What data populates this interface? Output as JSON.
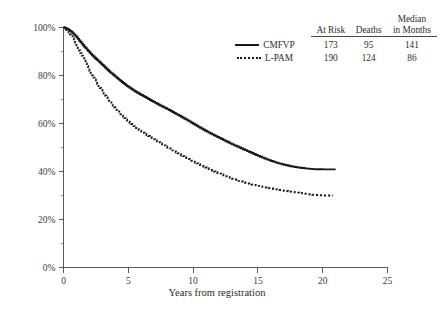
{
  "chart_data": {
    "type": "line",
    "title": "",
    "xlabel": "Years from registration",
    "ylabel": "",
    "xlim": [
      0,
      25
    ],
    "ylim": [
      0,
      100
    ],
    "grid": false,
    "x_ticks": [
      "0",
      "5",
      "10",
      "15",
      "20",
      "25"
    ],
    "x_tick_values": [
      0,
      5,
      10,
      15,
      20,
      25
    ],
    "y_ticks": [
      "0%",
      "20%",
      "40%",
      "60%",
      "80%",
      "100%"
    ],
    "y_tick_values": [
      0,
      20,
      40,
      60,
      80,
      100
    ],
    "y_minor_tick_values": [
      10,
      30,
      50,
      70,
      90
    ],
    "legend_position": "top-right",
    "series": [
      {
        "name": "CMFVP",
        "style": "solid",
        "at_risk": 173,
        "deaths": 95,
        "median_months": 141,
        "x": [
          0,
          0.3,
          0.6,
          0.9,
          1.2,
          1.5,
          1.8,
          2.1,
          2.4,
          2.7,
          3.0,
          3.3,
          3.6,
          3.9,
          4.2,
          4.5,
          4.8,
          5.1,
          5.4,
          5.7,
          6.0,
          6.4,
          6.8,
          7.2,
          7.6,
          8.0,
          8.4,
          8.8,
          9.2,
          9.6,
          10.0,
          10.4,
          10.8,
          11.2,
          11.6,
          12.0,
          12.5,
          13.0,
          13.5,
          14.0,
          14.5,
          15.0,
          15.5,
          16.0,
          16.5,
          17.0,
          17.5,
          18.0,
          18.6,
          19.2,
          20.0,
          21.0
        ],
        "y": [
          100,
          99.4,
          98.2,
          96.6,
          94.6,
          92.6,
          90.8,
          89.0,
          87.4,
          85.9,
          84.4,
          82.8,
          81.3,
          80.0,
          78.6,
          77.3,
          76.0,
          74.9,
          73.8,
          72.8,
          71.9,
          70.6,
          69.4,
          68.2,
          67.1,
          66.0,
          64.8,
          63.6,
          62.4,
          61.2,
          59.9,
          58.6,
          57.4,
          56.2,
          55.1,
          54.0,
          52.6,
          51.3,
          50.1,
          48.9,
          47.7,
          46.5,
          45.4,
          44.4,
          43.5,
          42.8,
          42.2,
          41.7,
          41.3,
          41.0,
          40.9,
          40.9
        ]
      },
      {
        "name": "L-PAM",
        "style": "dotted",
        "at_risk": 190,
        "deaths": 124,
        "median_months": 86,
        "x": [
          0,
          0.3,
          0.6,
          0.9,
          1.2,
          1.5,
          1.8,
          2.1,
          2.4,
          2.7,
          3.0,
          3.3,
          3.6,
          3.9,
          4.2,
          4.5,
          4.8,
          5.1,
          5.4,
          5.7,
          6.0,
          6.4,
          6.8,
          7.2,
          7.6,
          8.0,
          8.4,
          8.8,
          9.2,
          9.6,
          10.0,
          10.4,
          10.8,
          11.2,
          11.6,
          12.0,
          12.5,
          13.0,
          13.5,
          14.0,
          14.5,
          15.0,
          15.5,
          16.0,
          16.5,
          17.0,
          17.5,
          18.0,
          18.6,
          19.2,
          20.0,
          20.8
        ],
        "y": [
          100,
          98.6,
          96.4,
          93.6,
          90.4,
          87.2,
          84.0,
          81.0,
          78.2,
          75.6,
          73.2,
          70.9,
          68.8,
          66.8,
          65.0,
          63.3,
          61.7,
          60.2,
          58.9,
          57.7,
          56.6,
          55.2,
          53.9,
          52.6,
          51.3,
          50.0,
          48.8,
          47.6,
          46.4,
          45.2,
          44.1,
          43.0,
          42.0,
          41.0,
          40.0,
          39.1,
          38.0,
          37.0,
          36.1,
          35.3,
          34.6,
          34.0,
          33.4,
          32.9,
          32.4,
          32.0,
          31.6,
          31.2,
          30.7,
          30.3,
          30.0,
          30.0
        ]
      }
    ]
  },
  "legend": {
    "headers": {
      "series": "",
      "at_risk": "At Risk",
      "deaths": "Deaths",
      "median_line1": "Median",
      "median_line2": "in Months"
    },
    "rows": [
      {
        "name": "CMFVP",
        "at_risk": "173",
        "deaths": "95",
        "median_months": "141"
      },
      {
        "name": "L-PAM",
        "at_risk": "190",
        "deaths": "124",
        "median_months": "86"
      }
    ]
  },
  "axes": {
    "x_title": "Years from registration",
    "x_tick_labels": [
      "0",
      "5",
      "10",
      "15",
      "20",
      "25"
    ],
    "y_tick_labels": [
      "0%",
      "20%",
      "40%",
      "60%",
      "80%",
      "100%"
    ]
  },
  "colors": {
    "curve": "#1a1a1a",
    "axis": "#5a5a5a",
    "text": "#2b2b2b"
  }
}
